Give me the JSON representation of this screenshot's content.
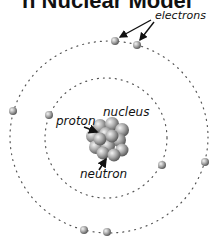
{
  "title": "n Nuclear Model",
  "labels": {
    "electrons": "electrons",
    "nucleus": "nucleus",
    "proton": "proton",
    "neutron": "neutron"
  },
  "colors": {
    "orbit_dots": "#555555",
    "electron": "#9a9a9a",
    "nucleon": "#8c8c8c",
    "arrow": "#111111",
    "text": "#111111"
  },
  "orbits": [
    {
      "name": "inner",
      "cx": 106,
      "cy": 138,
      "rx": 61,
      "ry": 60
    },
    {
      "name": "outer",
      "cx": 109,
      "cy": 137,
      "rx": 99,
      "ry": 96
    }
  ],
  "electrons": [
    {
      "x": 115,
      "y": 41
    },
    {
      "x": 137,
      "y": 45
    },
    {
      "x": 13,
      "y": 111
    },
    {
      "x": 49,
      "y": 115
    },
    {
      "x": 162,
      "y": 165
    },
    {
      "x": 205,
      "y": 162
    },
    {
      "x": 84,
      "y": 230
    },
    {
      "x": 107,
      "y": 232
    }
  ]
}
